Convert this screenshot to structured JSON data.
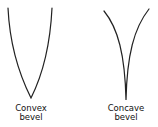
{
  "diagram": {
    "stroke_color": "#222222",
    "figures": [
      {
        "id": "convex",
        "label_line1": "Convex",
        "label_line2": "bevel"
      },
      {
        "id": "concave",
        "label_line1": "Concave",
        "label_line2": "bevel"
      }
    ]
  }
}
